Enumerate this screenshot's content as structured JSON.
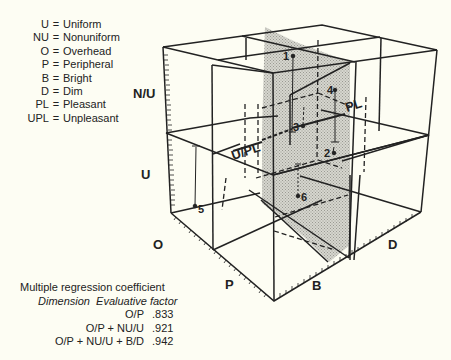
{
  "legend": {
    "items": [
      {
        "abbr": "U",
        "eq": "=",
        "meaning": "Uniform"
      },
      {
        "abbr": "NU",
        "eq": "=",
        "meaning": "Nonuniform"
      },
      {
        "abbr": "O",
        "eq": "=",
        "meaning": "Overhead"
      },
      {
        "abbr": "P",
        "eq": "=",
        "meaning": "Peripheral"
      },
      {
        "abbr": "B",
        "eq": "=",
        "meaning": "Bright"
      },
      {
        "abbr": "D",
        "eq": "=",
        "meaning": "Dim"
      },
      {
        "abbr": "PL",
        "eq": "=",
        "meaning": "Pleasant"
      },
      {
        "abbr": "UPL",
        "eq": "=",
        "meaning": "Unpleasant"
      }
    ]
  },
  "axes": {
    "vertical_top": "N/U",
    "vertical_bottom": "U",
    "left_near": "O",
    "left_far": "P",
    "right_near": "B",
    "right_far": "D"
  },
  "plane_labels": {
    "pleasant": "PL",
    "unpleasant": "U/PL"
  },
  "points": [
    {
      "label": "1"
    },
    {
      "label": "2"
    },
    {
      "label": "3"
    },
    {
      "label": "4"
    },
    {
      "label": "5"
    },
    {
      "label": "6"
    }
  ],
  "regression": {
    "title": "Multiple regression coefficient",
    "header_dimension": "Dimension",
    "header_factor": "Evaluative factor",
    "rows": [
      {
        "dimension": "O/P",
        "value": ".833"
      },
      {
        "dimension": "O/P + NU/U",
        "value": ".921"
      },
      {
        "dimension": "O/P + NU/U + B/D",
        "value": ".942"
      }
    ]
  },
  "colors": {
    "background": "#fdfdf3",
    "ink": "#222222",
    "plane_shade": "#c9c9c2"
  }
}
